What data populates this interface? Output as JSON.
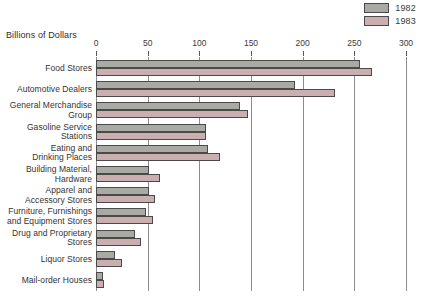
{
  "chart_data": {
    "type": "bar",
    "orientation": "horizontal",
    "title": "",
    "xlabel": "Billions of Dollars",
    "ylabel": "",
    "xlim": [
      0,
      300
    ],
    "xticks": [
      0,
      50,
      100,
      150,
      200,
      250,
      300
    ],
    "grid": true,
    "legend_position": "top-right",
    "categories": [
      "Food Stores",
      "Automotive Dealers",
      "General Merchandise\nGroup",
      "Gasoline Service\nStations",
      "Eating and\nDrinking Places",
      "Building Material,\nHardware",
      "Apparel and\nAccessory Stores",
      "Furniture, Furnishings\nand Equipment Stores",
      "Drug and Proprietary\nStores",
      "Liquor Stores",
      "Mail-order Houses"
    ],
    "series": [
      {
        "name": "1982",
        "color": "#a9aaa3",
        "values": [
          255,
          193,
          139,
          106,
          108,
          51,
          51,
          48,
          38,
          18,
          7
        ]
      },
      {
        "name": "1983",
        "color": "#cbaeb0",
        "values": [
          267,
          231,
          147,
          106,
          120,
          62,
          57,
          55,
          44,
          25,
          8
        ]
      }
    ]
  },
  "legend": {
    "items": [
      {
        "label": "1982",
        "color": "#a9aaa3"
      },
      {
        "label": "1983",
        "color": "#cbaeb0"
      }
    ]
  },
  "axis": {
    "title": "Billions of Dollars",
    "tick_labels": [
      "0",
      "50",
      "100",
      "150",
      "200",
      "250",
      "300"
    ]
  },
  "colors": {
    "series_1982": "#a9aaa3",
    "series_1983": "#cbaeb0",
    "bar_outline": "#4a4a4a",
    "gridline": "#8d8d8d",
    "text": "#333333"
  }
}
